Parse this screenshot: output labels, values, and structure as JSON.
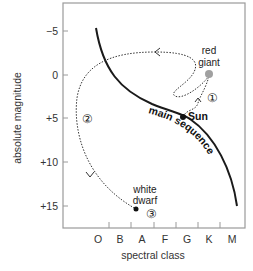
{
  "diagram": {
    "type": "Hertzsprung-Russell diagram (stellar evolution of the Sun)",
    "axes": {
      "x_label": "spectral class",
      "y_label": "absolute magnitude",
      "x_ticks": [
        "O",
        "B",
        "A",
        "F",
        "G",
        "K",
        "M"
      ],
      "y_ticks": [
        "−5",
        "0",
        "+5",
        "+10",
        "+15"
      ]
    },
    "curves": {
      "main_sequence_label": "main sequence"
    },
    "points": {
      "sun": "Sun",
      "red_giant_line1": "red",
      "red_giant_line2": "giant",
      "white_dwarf_line1": "white",
      "white_dwarf_line2": "dwarf"
    },
    "stages": {
      "stage1": "①",
      "stage2": "②",
      "stage3": "③"
    },
    "colors": {
      "frame": "#9a9a9a",
      "main_sequence": "#1a1a1a",
      "path": "#333333",
      "red_giant": "#a0a0a0",
      "sun": "#111111",
      "white_dwarf": "#111111"
    }
  }
}
